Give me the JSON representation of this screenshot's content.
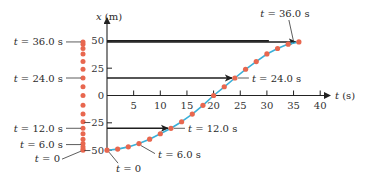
{
  "figure": {
    "x_axis_label": "x (m)",
    "t_axis_label": "t (s)",
    "x_ticks": [
      {
        "value": 50,
        "label": "50"
      },
      {
        "value": 25,
        "label": "25"
      },
      {
        "value": 0,
        "label": "0"
      },
      {
        "value": -25,
        "label": "−25"
      },
      {
        "value": -50,
        "label": "−50"
      }
    ],
    "t_ticks": [
      {
        "value": 5,
        "label": "5"
      },
      {
        "value": 10,
        "label": "10"
      },
      {
        "value": 15,
        "label": "15"
      },
      {
        "value": 20,
        "label": "20"
      },
      {
        "value": 25,
        "label": "25"
      },
      {
        "value": 30,
        "label": "30"
      },
      {
        "value": 35,
        "label": "35"
      },
      {
        "value": 40,
        "label": "40"
      }
    ],
    "column_labels": [
      {
        "t": 36,
        "text": "t = 36.0 s"
      },
      {
        "t": 24,
        "text": "t = 24.0 s"
      },
      {
        "t": 12,
        "text": "t = 12.0 s"
      },
      {
        "t": 6,
        "text": "t = 6.0 s"
      },
      {
        "t": 0,
        "text": "t = 0"
      }
    ],
    "curve_labels": [
      {
        "t": 36,
        "text": "t = 36.0 s"
      },
      {
        "t": 24,
        "text": "t = 24.0 s"
      },
      {
        "t": 12,
        "text": "t = 12.0 s"
      },
      {
        "t": 6,
        "text": "t = 6.0 s"
      },
      {
        "t": 0,
        "text": "t = 0"
      }
    ],
    "colors": {
      "dot": "#e8674f",
      "curve": "#3ab0d8",
      "axis": "#222222",
      "arrow": "#1e1e1e"
    }
  },
  "chart_data": {
    "type": "line",
    "title": "",
    "xlabel": "t (s)",
    "ylabel": "x (m)",
    "xlim": [
      0,
      40
    ],
    "ylim": [
      -50,
      50
    ],
    "x": [
      0,
      2,
      4,
      6,
      8,
      10,
      12,
      14,
      16,
      18,
      20,
      22,
      24,
      26,
      28,
      30,
      32,
      34,
      36
    ],
    "series": [
      {
        "name": "position x(t)",
        "values": [
          -50,
          -49,
          -47,
          -44,
          -40,
          -35,
          -30,
          -24,
          -17,
          -9,
          0,
          8,
          16,
          24,
          31,
          38,
          43,
          47,
          49
        ]
      }
    ],
    "annotations": [
      "t = 0",
      "t = 6.0 s",
      "t = 12.0 s",
      "t = 24.0 s",
      "t = 36.0 s"
    ],
    "grid": false
  }
}
